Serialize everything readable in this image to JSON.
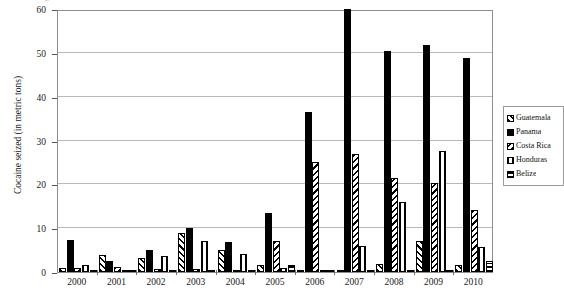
{
  "figure": {
    "top_clipped_title": "Figure: Cocaine seized in Central America, 2000-2010"
  },
  "chart_data": {
    "type": "bar",
    "title": "",
    "xlabel": "",
    "ylabel": "Cocaine seized (in metric tons)",
    "ylim": [
      0,
      60
    ],
    "yticks": [
      0,
      10,
      20,
      30,
      40,
      50,
      60
    ],
    "ytick_labels": [
      "0",
      "10",
      "20",
      "30",
      "40",
      "50",
      "60"
    ],
    "grid": true,
    "grid_axis": "y",
    "legend_position": "right",
    "categories": [
      "2000",
      "2001",
      "2002",
      "2003",
      "2004",
      "2005",
      "2006",
      "2007",
      "2008",
      "2009",
      "2010"
    ],
    "series": [
      {
        "name": "Guatemala",
        "pattern": "forward-diagonal",
        "color": "#000000",
        "values": [
          1.0,
          3.8,
          3.2,
          9.0,
          5.0,
          1.5,
          0.3,
          0.4,
          1.8,
          7.0,
          1.5
        ]
      },
      {
        "name": "Panama",
        "pattern": "solid",
        "color": "#000000",
        "values": [
          7.4,
          2.6,
          5.0,
          10.0,
          6.8,
          13.5,
          36.4,
          60.0,
          50.4,
          51.9,
          48.8
        ]
      },
      {
        "name": "Costa Rica",
        "pattern": "backward-diagonal",
        "color": "#000000",
        "values": [
          1.0,
          1.2,
          0.8,
          0.6,
          0.3,
          7.0,
          25.0,
          27.0,
          21.5,
          20.2,
          14.1
        ]
      },
      {
        "name": "Honduras",
        "pattern": "vertical",
        "color": "#000000",
        "values": [
          1.5,
          0.4,
          3.6,
          7.0,
          4.0,
          1.0,
          0.5,
          6.0,
          15.9,
          27.6,
          5.8
        ]
      },
      {
        "name": "Belize",
        "pattern": "horizontal",
        "color": "#000000",
        "values": [
          0.2,
          0.2,
          0.2,
          0.4,
          0.5,
          1.6,
          0.3,
          0.3,
          0.3,
          0.4,
          2.5
        ]
      }
    ]
  },
  "legend": {
    "items": [
      {
        "label": "Guatemala",
        "pattern": "forward-diagonal"
      },
      {
        "label": "Panama",
        "pattern": "solid"
      },
      {
        "label": "Costa Rica",
        "pattern": "backward-diagonal"
      },
      {
        "label": "Honduras",
        "pattern": "vertical"
      },
      {
        "label": "Belize",
        "pattern": "horizontal"
      }
    ]
  }
}
